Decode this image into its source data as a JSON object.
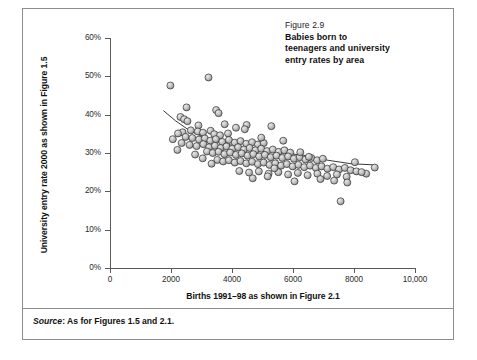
{
  "caption": {
    "figure_number": "Figure 2.9",
    "title_line1": "Babies born to",
    "title_line2": "teenagers and university",
    "title_line3": "entry rates by area"
  },
  "source": {
    "label": "Source",
    "separator": ": ",
    "text": "As for Figures 1.5 and 2.1."
  },
  "colors": {
    "marker_fill": "#c9c9c9",
    "marker_shade": "#8f8f8f",
    "marker_stroke": "#2e2e2e",
    "marker_highlight": "#e8e8e8",
    "axis": "#5a5a5a",
    "trend_line": "#222222",
    "frame": "#8d8d8d",
    "text": "#111111"
  },
  "chart_data": {
    "type": "scatter",
    "title": "Babies born to teenagers and university entry rates by area",
    "xlabel": "Births 1991–98 as shown in Figure 2.1",
    "ylabel": "University entry rate 2000 as shown in Figure 1.5",
    "xlim": [
      0,
      10000
    ],
    "ylim": [
      0,
      60
    ],
    "xticks": [
      0,
      2000,
      4000,
      6000,
      8000,
      10000
    ],
    "xtick_labels": [
      "0",
      "2000",
      "4000",
      "6000",
      "8000",
      "10,000"
    ],
    "yticks": [
      0,
      10,
      20,
      30,
      40,
      50,
      60
    ],
    "ytick_labels": [
      "0%",
      "10%",
      "20%",
      "30%",
      "40%",
      "50%",
      "60%"
    ],
    "grid": false,
    "legend": false,
    "y_unit": "percent",
    "series": [
      {
        "name": "Areas",
        "marker": "sphere-3d",
        "points": [
          [
            1980,
            47.6
          ],
          [
            3230,
            49.7
          ],
          [
            2510,
            41.9
          ],
          [
            3480,
            41.2
          ],
          [
            3560,
            40.4
          ],
          [
            2310,
            39.4
          ],
          [
            2430,
            38.8
          ],
          [
            2540,
            38.3
          ],
          [
            3760,
            37.5
          ],
          [
            4480,
            37.3
          ],
          [
            2900,
            37.2
          ],
          [
            4130,
            36.6
          ],
          [
            4420,
            36.2
          ],
          [
            5290,
            37.0
          ],
          [
            2650,
            35.9
          ],
          [
            2380,
            35.4
          ],
          [
            2230,
            35.1
          ],
          [
            2880,
            35.6
          ],
          [
            3050,
            35.3
          ],
          [
            3300,
            35.8
          ],
          [
            3420,
            34.9
          ],
          [
            3610,
            34.6
          ],
          [
            3870,
            35.1
          ],
          [
            2060,
            33.6
          ],
          [
            2480,
            34.2
          ],
          [
            2700,
            33.9
          ],
          [
            2920,
            33.5
          ],
          [
            3110,
            33.8
          ],
          [
            3290,
            33.2
          ],
          [
            3470,
            33.6
          ],
          [
            3680,
            32.9
          ],
          [
            3900,
            33.4
          ],
          [
            4090,
            32.7
          ],
          [
            4280,
            33.1
          ],
          [
            4470,
            32.4
          ],
          [
            4660,
            32.8
          ],
          [
            4850,
            32.2
          ],
          [
            5040,
            32.6
          ],
          [
            2610,
            32.1
          ],
          [
            2840,
            31.8
          ],
          [
            3060,
            32.3
          ],
          [
            3250,
            31.5
          ],
          [
            3440,
            31.9
          ],
          [
            3630,
            31.3
          ],
          [
            3820,
            31.7
          ],
          [
            4010,
            31.1
          ],
          [
            4200,
            31.5
          ],
          [
            4390,
            30.9
          ],
          [
            4580,
            31.3
          ],
          [
            4770,
            30.7
          ],
          [
            4960,
            31.1
          ],
          [
            5150,
            30.5
          ],
          [
            5340,
            30.9
          ],
          [
            5530,
            30.3
          ],
          [
            5720,
            30.7
          ],
          [
            5910,
            30.1
          ],
          [
            3180,
            30.4
          ],
          [
            3370,
            30.0
          ],
          [
            3560,
            30.3
          ],
          [
            3750,
            29.7
          ],
          [
            3940,
            30.1
          ],
          [
            4130,
            29.5
          ],
          [
            4320,
            29.9
          ],
          [
            4510,
            29.3
          ],
          [
            4700,
            29.7
          ],
          [
            4890,
            29.1
          ],
          [
            5080,
            29.5
          ],
          [
            5270,
            28.9
          ],
          [
            5460,
            29.3
          ],
          [
            5650,
            28.7
          ],
          [
            5840,
            29.1
          ],
          [
            6030,
            28.5
          ],
          [
            6220,
            28.9
          ],
          [
            6410,
            28.3
          ],
          [
            6600,
            28.7
          ],
          [
            6790,
            28.1
          ],
          [
            6980,
            28.5
          ],
          [
            3520,
            28.2
          ],
          [
            3710,
            27.8
          ],
          [
            3900,
            28.1
          ],
          [
            4090,
            27.5
          ],
          [
            4280,
            27.9
          ],
          [
            4470,
            27.3
          ],
          [
            4660,
            27.7
          ],
          [
            4850,
            27.1
          ],
          [
            5040,
            27.5
          ],
          [
            5230,
            26.9
          ],
          [
            5420,
            27.3
          ],
          [
            5610,
            26.7
          ],
          [
            5800,
            27.1
          ],
          [
            5990,
            26.5
          ],
          [
            6180,
            26.9
          ],
          [
            6370,
            26.3
          ],
          [
            6560,
            26.7
          ],
          [
            6750,
            26.1
          ],
          [
            6940,
            26.5
          ],
          [
            7130,
            25.9
          ],
          [
            7320,
            26.3
          ],
          [
            7510,
            25.7
          ],
          [
            7700,
            26.1
          ],
          [
            7890,
            25.5
          ],
          [
            4240,
            25.3
          ],
          [
            4560,
            24.9
          ],
          [
            4880,
            25.2
          ],
          [
            5200,
            24.6
          ],
          [
            5520,
            25.0
          ],
          [
            5840,
            24.4
          ],
          [
            6160,
            24.8
          ],
          [
            6480,
            24.2
          ],
          [
            6800,
            24.6
          ],
          [
            7120,
            24.0
          ],
          [
            7440,
            24.4
          ],
          [
            7760,
            23.8
          ],
          [
            8080,
            25.2
          ],
          [
            8400,
            24.6
          ],
          [
            8680,
            26.2
          ],
          [
            6900,
            23.2
          ],
          [
            7350,
            22.8
          ],
          [
            7780,
            22.3
          ],
          [
            7560,
            17.4
          ],
          [
            2210,
            30.8
          ],
          [
            2350,
            32.6
          ],
          [
            5680,
            33.2
          ],
          [
            4960,
            34.0
          ],
          [
            6240,
            30.2
          ],
          [
            6520,
            29.0
          ],
          [
            8030,
            27.6
          ],
          [
            8250,
            25.0
          ],
          [
            5390,
            26.0
          ],
          [
            2790,
            29.6
          ],
          [
            3040,
            28.6
          ],
          [
            3330,
            27.2
          ],
          [
            4680,
            23.4
          ],
          [
            5170,
            23.9
          ],
          [
            6050,
            22.6
          ]
        ]
      }
    ],
    "trend_line": {
      "type": "fitted-curve",
      "description": "downward-sloping fitted trend line",
      "points": [
        [
          1760,
          41.0
        ],
        [
          2150,
          38.4
        ],
        [
          2600,
          35.9
        ],
        [
          3100,
          34.0
        ],
        [
          3650,
          32.6
        ],
        [
          4250,
          31.6
        ],
        [
          4900,
          30.8
        ],
        [
          5600,
          30.1
        ],
        [
          6350,
          29.4
        ],
        [
          7150,
          28.1
        ],
        [
          7900,
          27.2
        ],
        [
          8650,
          26.9
        ]
      ]
    }
  }
}
